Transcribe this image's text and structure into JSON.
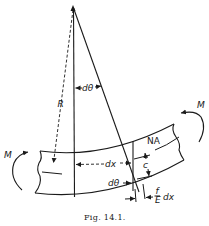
{
  "figure": {
    "caption": "Fig. 14.1.",
    "labels": {
      "radius": "R",
      "angle_top": "dθ",
      "moment_left": "M",
      "moment_right": "M",
      "neutral_axis": "NA",
      "element_length": "dx",
      "angle_bottom": "dθ",
      "distance_c": "c",
      "strain_num": "f",
      "strain_den": "E",
      "strain_dx": "dx"
    }
  }
}
